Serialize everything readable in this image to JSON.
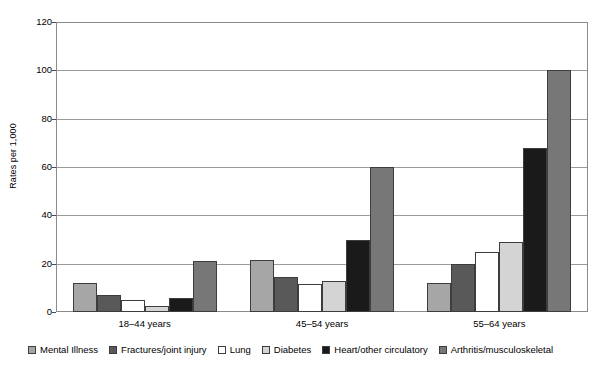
{
  "chart_data": {
    "type": "bar",
    "title": "",
    "subtitle": "",
    "xlabel": "",
    "ylabel": "Rates per 1,000",
    "ylim": [
      0,
      120
    ],
    "yticks": [
      0,
      20,
      40,
      60,
      80,
      100,
      120
    ],
    "ytick_labels": [
      "0",
      "20",
      "40",
      "60",
      "80",
      "100",
      "120"
    ],
    "grid": true,
    "legend_position": "bottom",
    "categories": [
      "18–44 years",
      "45–54 years",
      "55–64 years"
    ],
    "series": [
      {
        "name": "Mental Illness",
        "color": "#a6a6a6",
        "values": [
          12,
          21.5,
          12
        ]
      },
      {
        "name": "Fractures/joint injury",
        "color": "#595959",
        "values": [
          7,
          14.5,
          20
        ]
      },
      {
        "name": "Lung",
        "color": "#ffffff",
        "values": [
          5,
          11.5,
          25
        ]
      },
      {
        "name": "Diabetes",
        "color": "#d4d4d4",
        "values": [
          2.5,
          13,
          29
        ]
      },
      {
        "name": "Heart/other circulatory",
        "color": "#1a1a1a",
        "values": [
          6,
          30,
          68
        ]
      },
      {
        "name": "Arthritis/musculoskeletal",
        "color": "#777777",
        "values": [
          21,
          60,
          100
        ]
      }
    ]
  },
  "axis": {
    "y_title": "Rates per 1,000"
  }
}
